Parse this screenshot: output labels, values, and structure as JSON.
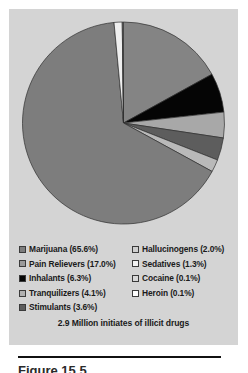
{
  "chart_data": {
    "type": "pie",
    "title": "",
    "caption": "2.9 Million initiates of illicit drugs",
    "categories": [
      "Marijuana",
      "Pain Relievers",
      "Inhalants",
      "Tranquilizers",
      "Stimulants",
      "Hallucinogens",
      "Sedatives",
      "Cocaine",
      "Heroin"
    ],
    "values": [
      65.6,
      17.0,
      6.3,
      4.1,
      3.6,
      2.0,
      1.3,
      0.1,
      0.1
    ],
    "unit": "%",
    "start_angle_deg": 0,
    "direction": "clockwise",
    "legend_position": "bottom",
    "grid": false,
    "slices": [
      {
        "label": "Marijuana",
        "value": 65.6,
        "display": "Marijuana (65.6%)",
        "color": "#7d7d7d",
        "order": 5
      },
      {
        "label": "Pain Relievers",
        "value": 17.0,
        "display": "Pain Relievers (17.0%)",
        "color": "#848484",
        "order": 0
      },
      {
        "label": "Inhalants",
        "value": 6.3,
        "display": "Inhalants (6.3%)",
        "color": "#050505",
        "order": 1
      },
      {
        "label": "Tranquilizers",
        "value": 4.1,
        "display": "Tranquilizers (4.1%)",
        "color": "#a8a8a8",
        "order": 2
      },
      {
        "label": "Stimulants",
        "value": 3.6,
        "display": "Stimulants (3.6%)",
        "color": "#5d5d5d",
        "order": 3
      },
      {
        "label": "Hallucinogens",
        "value": 2.0,
        "display": "Hallucinogens (2.0%)",
        "color": "#b9b9b9",
        "order": 4
      },
      {
        "label": "Sedatives",
        "value": 1.3,
        "display": "Sedatives (1.3%)",
        "color": "#efefef",
        "order": 6
      },
      {
        "label": "Cocaine",
        "value": 0.1,
        "display": "Cocaine (0.1%)",
        "color": "#c9c9c9",
        "order": 7
      },
      {
        "label": "Heroin",
        "value": 0.1,
        "display": "Heroin (0.1%)",
        "color": "#fbfbfb",
        "order": 8
      }
    ]
  },
  "legend": {
    "left_column": [
      {
        "display": "Marijuana (65.6%)",
        "color": "#7d7d7d"
      },
      {
        "display": "Pain Relievers (17.0%)",
        "color": "#9a9a9a"
      },
      {
        "display": "Inhalants (6.3%)",
        "color": "#050505"
      },
      {
        "display": "Tranquilizers (4.1%)",
        "color": "#b0b0b0"
      },
      {
        "display": "Stimulants (3.6%)",
        "color": "#5d5d5d"
      }
    ],
    "right_column": [
      {
        "display": "Hallucinogens (2.0%)",
        "color": "#cfcfcf"
      },
      {
        "display": "Sedatives (1.3%)",
        "color": "#f2f2f2"
      },
      {
        "display": "Cocaine (0.1%)",
        "color": "#d8d8d8"
      },
      {
        "display": "Heroin (0.1%)",
        "color": "#fdfdfd"
      }
    ]
  },
  "caption": "2.9 Million initiates of illicit drugs",
  "figure_caption_partial": "Figure 15.5",
  "colors": {
    "panel_background": "#d4d4d4",
    "page_background": "#ffffff",
    "text": "#1a1a1a",
    "slice_outline": "#2f2f2f",
    "rule": "#111111"
  }
}
